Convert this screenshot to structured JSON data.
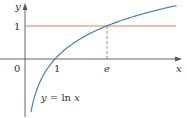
{
  "chart_data": {
    "type": "line",
    "title": "",
    "xlabel": "x",
    "ylabel": "y",
    "series": [
      {
        "name": "y = ln x",
        "function": "ln(x)",
        "color": "#4a7fb5",
        "x": [
          0.2,
          0.5,
          1,
          1.5,
          2,
          2.718,
          3,
          4,
          5
        ],
        "values": [
          -1.609,
          -0.693,
          0,
          0.405,
          0.693,
          1,
          1.099,
          1.386,
          1.609
        ]
      },
      {
        "name": "y = 1",
        "function": "1",
        "color": "#e07a5f",
        "x": [
          0,
          5
        ],
        "values": [
          1,
          1
        ]
      }
    ],
    "annotations": [
      {
        "type": "dashed-vertical",
        "x": 2.718,
        "from_y": 0,
        "to_y": 1,
        "label": "e"
      },
      {
        "type": "curve-label",
        "text": "y = ln x",
        "x": 1.0,
        "y": -1.4
      }
    ],
    "x_ticks": [
      {
        "value": 0,
        "label": "0"
      },
      {
        "value": 1,
        "label": "1"
      },
      {
        "value": 2.718,
        "label": "e"
      }
    ],
    "y_ticks": [
      {
        "value": 1,
        "label": "1"
      }
    ],
    "xlim": [
      -0.8,
      5.2
    ],
    "ylim": [
      -1.8,
      1.8
    ],
    "grid": false,
    "legend": "none"
  },
  "labels": {
    "y_axis": "y",
    "x_axis": "x",
    "origin": "0",
    "x_tick_one": "1",
    "x_tick_e": "e",
    "y_tick_one": "1",
    "curve_label_y": "y",
    "curve_label_eq": " = ln ",
    "curve_label_x": "x"
  },
  "colors": {
    "curve": "#4a7fb5",
    "line_y1": "#e07a5f",
    "axes": "#555555",
    "dash": "#c0504d"
  }
}
